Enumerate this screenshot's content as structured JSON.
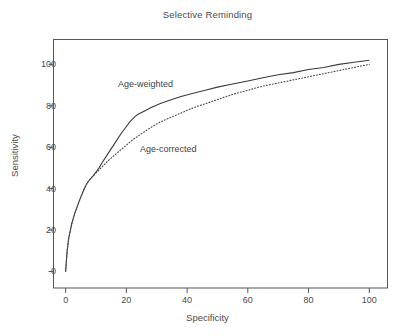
{
  "chart_data": {
    "type": "line",
    "title": "Selective Reminding",
    "xlabel": "Specificity",
    "ylabel": "Sensitivity",
    "xlim": [
      -4,
      106
    ],
    "ylim": [
      -8,
      112
    ],
    "xticks": [
      0,
      20,
      40,
      60,
      80,
      100
    ],
    "yticks": [
      0,
      20,
      40,
      60,
      80,
      100
    ],
    "xtick_labels": [
      "0",
      "20",
      "40",
      "60",
      "80",
      "100"
    ],
    "ytick_labels": [
      "0",
      "20",
      "40",
      "60",
      "80",
      "100"
    ],
    "grid": false,
    "legend_position": "inline-annotations",
    "series": [
      {
        "name": "Age-weighted",
        "style": "solid",
        "color": "#3a3a3a",
        "label_x": 26,
        "label_y": 90,
        "x": [
          0,
          0.5,
          1,
          2,
          3,
          4,
          5,
          6,
          7,
          8,
          9,
          10,
          11,
          12,
          14,
          16,
          18,
          20,
          21,
          22,
          23,
          24,
          26,
          28,
          31,
          34,
          38,
          42,
          46,
          50,
          55,
          60,
          65,
          70,
          75,
          80,
          85,
          90,
          95,
          100
        ],
        "y": [
          0,
          10,
          16,
          23,
          28,
          32,
          36,
          39.5,
          42.5,
          44.5,
          46,
          48,
          50,
          52.5,
          57,
          61.5,
          66,
          70,
          72,
          73.5,
          75,
          76,
          77.5,
          79,
          81,
          82.5,
          84.5,
          86,
          87.5,
          89,
          90.5,
          92,
          93.5,
          95,
          96,
          97.5,
          98.5,
          100,
          101,
          102
        ]
      },
      {
        "name": "Age-corrected",
        "style": "dotted",
        "color": "#4a4a4a",
        "label_x": 33,
        "label_y": 58,
        "x": [
          0,
          0.5,
          1,
          2,
          3,
          4,
          5,
          6,
          7,
          8,
          9,
          10,
          11,
          12,
          14,
          16,
          18,
          20,
          22,
          24,
          26,
          28,
          31,
          34,
          38,
          42,
          46,
          50,
          55,
          60,
          65,
          70,
          75,
          80,
          85,
          90,
          95,
          100
        ],
        "y": [
          0,
          10,
          16,
          23,
          28,
          32,
          36,
          39.5,
          42.5,
          44.5,
          46,
          47.5,
          49,
          50.5,
          53.5,
          56,
          58.5,
          61,
          63.5,
          65.5,
          67.5,
          69.5,
          72,
          74,
          76.5,
          79,
          81,
          83,
          85.5,
          87.5,
          89.5,
          91,
          92.5,
          94,
          95.5,
          97,
          98.5,
          100
        ]
      }
    ]
  },
  "figure": {
    "background_color": "#ffffff",
    "axis_color": "#555555",
    "text_color": "#4a4a4a"
  }
}
